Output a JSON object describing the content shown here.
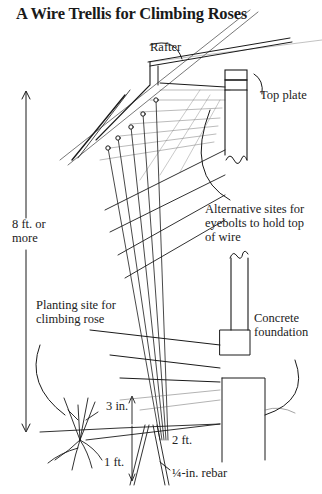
{
  "title": "A Wire Trellis for Climbing Roses",
  "labels": {
    "rafter": "Rafter",
    "top_plate": "Top plate",
    "height": [
      "8 ft. or",
      "more"
    ],
    "alternative_sites": [
      "Alternative sites for",
      "eyebolts to hold top",
      "of wire"
    ],
    "planting_site": [
      "Planting site for",
      "climbing rose"
    ],
    "concrete_foundation": [
      "Concrete",
      "foundation"
    ],
    "depth": "3 in.",
    "distance": "2 ft.",
    "rebar_depth": "1 ft.",
    "rebar": "¼-in. rebar"
  },
  "colors": {
    "ink": "#1a1a1a",
    "background": "#ffffff",
    "shade": "#8a8a8a"
  }
}
